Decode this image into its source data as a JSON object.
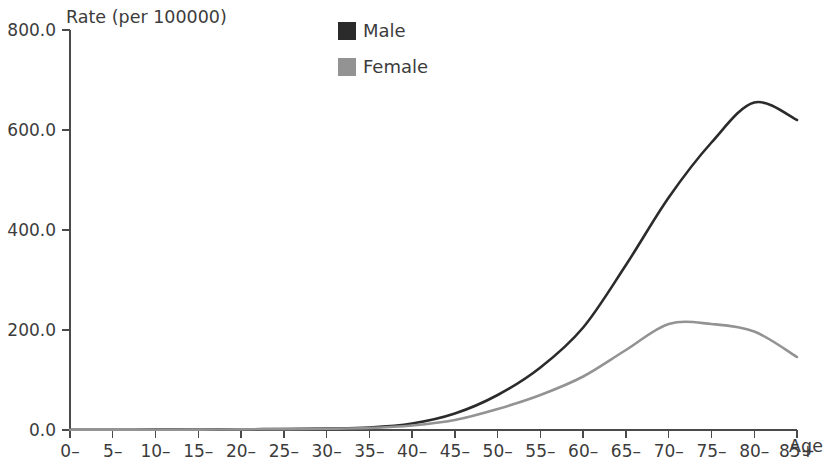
{
  "chart_data": {
    "type": "line",
    "title": "",
    "ylabel": "Rate (per 100000)",
    "xlabel": "Age",
    "categories": [
      "0–",
      "5–",
      "10–",
      "15–",
      "20–",
      "25–",
      "30–",
      "35–",
      "40–",
      "45–",
      "50–",
      "55–",
      "60–",
      "65–",
      "70–",
      "75–",
      "80–",
      "85+"
    ],
    "ylim": [
      0,
      800
    ],
    "yticks": [
      0,
      200,
      400,
      600,
      800
    ],
    "ytick_labels": [
      "0.0",
      "200.0",
      "400.0",
      "600.0",
      "800.0"
    ],
    "grid": false,
    "legend_position": "top-center",
    "series": [
      {
        "name": "Male",
        "color": "#2b2b2b",
        "values": [
          0.5,
          0.5,
          0.7,
          1.0,
          1.5,
          2.0,
          3.0,
          5.0,
          13.0,
          33.0,
          70.0,
          125.0,
          205.0,
          330.0,
          465.0,
          575.0,
          655.0,
          620.0
        ]
      },
      {
        "name": "Female",
        "color": "#939393",
        "values": [
          0.4,
          0.4,
          0.5,
          0.8,
          1.2,
          1.8,
          2.5,
          4.0,
          9.0,
          20.0,
          42.0,
          70.0,
          107.0,
          160.0,
          212.0,
          212.0,
          197.0,
          146.0
        ]
      }
    ]
  },
  "axis": {
    "y_title": "Rate (per 100000)",
    "x_title": "Age"
  },
  "legend": {
    "items": [
      {
        "label": "Male",
        "swatch_color": "#2b2b2b"
      },
      {
        "label": "Female",
        "swatch_color": "#939393"
      }
    ]
  }
}
